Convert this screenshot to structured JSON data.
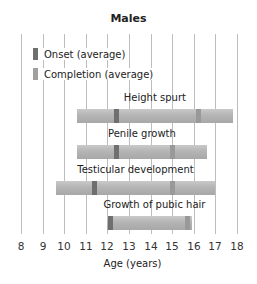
{
  "chart_data": {
    "type": "bar",
    "orientation": "horizontal-range",
    "title": "Males",
    "xlabel": "Age (years)",
    "ylabel": "",
    "xlim": [
      8,
      18
    ],
    "xticks": [
      8,
      9,
      10,
      11,
      12,
      13,
      14,
      15,
      16,
      17,
      18
    ],
    "grid": true,
    "legend": [
      {
        "label": "Onset (average)",
        "color": "#6f6f6f"
      },
      {
        "label": "Completion (average)",
        "color": "#999999"
      }
    ],
    "legend_position": "upper-left",
    "series": [
      {
        "name": "Height spurt",
        "start": 10.6,
        "end": 17.8,
        "onset": 12.4,
        "completion": 16.2
      },
      {
        "name": "Penile growth",
        "start": 10.6,
        "end": 16.6,
        "onset": 12.4,
        "completion": 15.0
      },
      {
        "name": "Testicular development",
        "start": 9.6,
        "end": 17.0,
        "onset": 11.4,
        "completion": 15.0
      },
      {
        "name": "Growth of pubic hair",
        "start": 12.0,
        "end": 15.9,
        "onset": 12.1,
        "completion": 15.7
      }
    ]
  },
  "colors": {
    "bar": "#b5b5b5",
    "onset": "#6f6f6f",
    "completion": "#999999",
    "grid": "#bdbdbd"
  }
}
